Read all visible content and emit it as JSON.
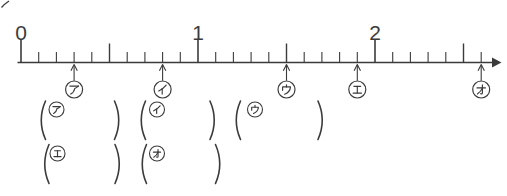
{
  "figure": {
    "number_line": {
      "start": 0,
      "end": 2.6,
      "minor_step": 0.1,
      "mid_tick_values": [
        0.5,
        1.5,
        2.5
      ],
      "major_labels": [
        {
          "value": 0,
          "text": "0"
        },
        {
          "value": 1,
          "text": "1"
        },
        {
          "value": 2,
          "text": "2"
        }
      ],
      "pointers": [
        {
          "label": "ア",
          "romaji": "a",
          "value": 0.3
        },
        {
          "label": "イ",
          "romaji": "i",
          "value": 0.8
        },
        {
          "label": "ウ",
          "romaji": "u",
          "value": 1.5
        },
        {
          "label": "エ",
          "romaji": "e",
          "value": 1.9
        },
        {
          "label": "オ",
          "romaji": "o",
          "value": 2.6
        }
      ]
    },
    "answer_rows": [
      {
        "blanks": [
          {
            "label": "ア",
            "romaji": "a",
            "value": ""
          },
          {
            "label": "イ",
            "romaji": "i",
            "value": ""
          },
          {
            "label": "ウ",
            "romaji": "u",
            "value": ""
          }
        ]
      },
      {
        "blanks": [
          {
            "label": "エ",
            "romaji": "e",
            "value": ""
          },
          {
            "label": "オ",
            "romaji": "o",
            "value": ""
          }
        ]
      }
    ],
    "colors": {
      "ink": "#3b3b3b",
      "background": "#ffffff"
    }
  }
}
